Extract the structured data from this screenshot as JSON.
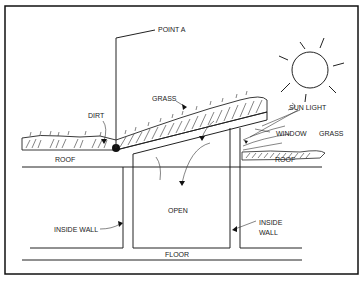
{
  "diagram": {
    "labels": {
      "point_a": "POINT A",
      "grass_top": "GRASS",
      "dirt": "DIRT",
      "sun_light": "SUN LIGHT",
      "window": "WINDOW",
      "grass_right": "GRASS",
      "roof_left": "ROOF",
      "roof_right": "ROOF",
      "open": "OPEN",
      "inside_wall_left": "INSIDE WALL",
      "inside_wall_right_1": "INSIDE",
      "inside_wall_right_2": "WALL",
      "floor": "FLOOR"
    },
    "icons": [
      "sun-icon",
      "point-a-marker"
    ],
    "colors": {
      "ink": "#222222",
      "background": "#ffffff"
    }
  }
}
